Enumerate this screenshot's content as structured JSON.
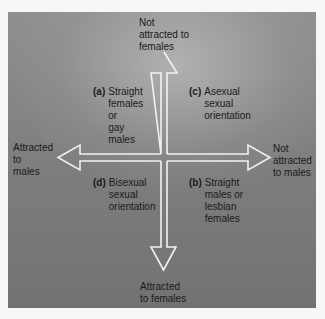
{
  "figure": {
    "axis_labels": {
      "top": "Not\nattracted to\nfemales",
      "bottom": "Attracted\nto females",
      "left": "Attracted\nto\nmales",
      "right": "Not\nattracted\nto males"
    },
    "quadrants": [
      {
        "id": "a",
        "letter": "(a)",
        "text": "Straight\nfemales\nor\ngay\nmales",
        "position": "upper-left"
      },
      {
        "id": "b",
        "letter": "(b)",
        "text": "Straight\nmales or\nlesbian\nfemales",
        "position": "lower-right"
      },
      {
        "id": "c",
        "letter": "(c)",
        "text": "Asexual\nsexual\norientation",
        "position": "upper-right"
      },
      {
        "id": "d",
        "letter": "(d)",
        "text": "Bisexual\nsexual\norientation",
        "position": "lower-left"
      }
    ],
    "colors": {
      "background": "#7d7d7d",
      "arrow_stroke": "#f2f2f2",
      "text": "#1a1a1a"
    }
  }
}
